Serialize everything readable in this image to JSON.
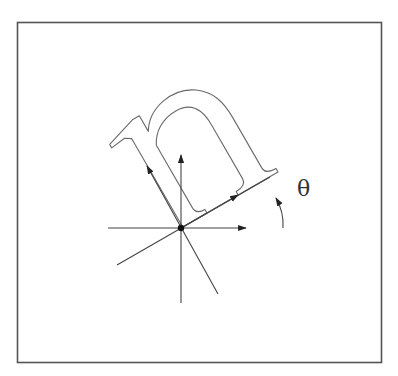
{
  "figure": {
    "title": "",
    "rotated_glyph": "n",
    "angle_label": "θ",
    "colors": {
      "stroke": "#444444",
      "glyph_outline": "#6a6a6a",
      "frame": "#555555",
      "background": "#ffffff",
      "origin_dot": "#111111"
    },
    "elements": [
      {
        "name": "frame",
        "type": "rectangle"
      },
      {
        "name": "horizontal-axis",
        "type": "arrow",
        "direction": "right"
      },
      {
        "name": "vertical-axis",
        "type": "arrow",
        "direction": "up"
      },
      {
        "name": "rotated-x-axis",
        "type": "arrow",
        "direction": "up-right"
      },
      {
        "name": "rotated-y-axis",
        "type": "arrow",
        "direction": "up-left"
      },
      {
        "name": "rotation-arc",
        "type": "curved-arrow",
        "label": "θ"
      },
      {
        "name": "origin-point",
        "type": "dot"
      },
      {
        "name": "rotated-letter-n",
        "type": "outlined-glyph"
      }
    ]
  }
}
